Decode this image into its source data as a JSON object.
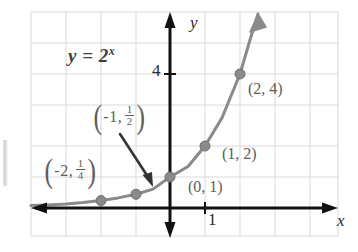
{
  "figure": {
    "equation": {
      "base": "y = 2",
      "exponent": "x",
      "full": "y = 2^x"
    },
    "axes": {
      "x_label": "x",
      "y_label": "y",
      "x_tick_label": "1",
      "y_tick_label": "4",
      "axis_color": "#111111",
      "grid_color": "#d9d9d9"
    },
    "curve": {
      "color": "#8a8a8a",
      "point_color": "#8a8a8a"
    },
    "points": [
      {
        "id": "p-neg2",
        "x": -2,
        "y": 0.25,
        "label": "(-2, 1/4)",
        "label_open": "(",
        "label_x": "-2",
        "label_comma": ",",
        "label_num": "1",
        "label_den": "4",
        "label_close": ")"
      },
      {
        "id": "p-neg1",
        "x": -1,
        "y": 0.5,
        "label": "(-1, 1/2)",
        "label_open": "(",
        "label_x": "-1",
        "label_comma": ",",
        "label_num": "1",
        "label_den": "2",
        "label_close": ")"
      },
      {
        "id": "p-zero",
        "x": 0,
        "y": 1,
        "label": "(0, 1)"
      },
      {
        "id": "p-one",
        "x": 1,
        "y": 2,
        "label": "(1, 2)"
      },
      {
        "id": "p-two",
        "x": 2,
        "y": 4,
        "label": "(2, 4)"
      }
    ],
    "annotation_arrow": {
      "name": "pointer-arrow",
      "from_label": "(-1, 1/2)",
      "to_point": "(-1, 0.5)"
    }
  }
}
